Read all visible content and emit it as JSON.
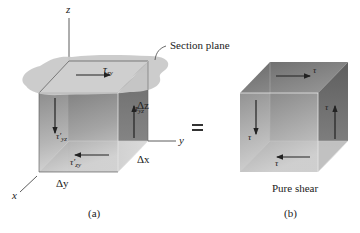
{
  "figure_a": {
    "caption": "(a)",
    "section_plane_label": "Section plane",
    "axes": {
      "x": "x",
      "y": "y",
      "z": "z"
    },
    "dimensions": {
      "dx": "Δx",
      "dy": "Δy",
      "dz": "Δz"
    },
    "stresses": {
      "top": {
        "symbol": "τ",
        "sub": "zy"
      },
      "right": {
        "symbol": "τ",
        "sub": "yz"
      },
      "left": {
        "symbol": "τ′",
        "sub": "yz"
      },
      "bottom": {
        "symbol": "τ′",
        "sub": "zy"
      }
    }
  },
  "equals_sign": "=",
  "figure_b": {
    "caption": "(b)",
    "title": "Pure shear",
    "stresses": {
      "top": "τ",
      "right": "τ",
      "left": "τ",
      "bottom": "τ"
    }
  },
  "colors": {
    "cube_dark": "#6e6e6e",
    "cube_light": "#d8d8d8",
    "section_plane": "#c8c8c8",
    "edges": "#444444",
    "arrows": "#222222"
  }
}
